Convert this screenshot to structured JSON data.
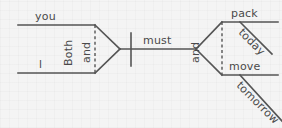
{
  "diagram": {
    "type": "reed-kellogg-sentence-diagram",
    "sentence": "Both you and I must pack today and move tomorrow.",
    "colors": {
      "background": "#f4f4f4",
      "line": "#555555",
      "text": "#4a4a4a"
    },
    "words": {
      "subject_1": "you",
      "subject_2": "I",
      "conjunction_left_1": "Both",
      "conjunction_left_2": "and",
      "verb_helper": "must",
      "conjunction_right": "and",
      "verb_1": "pack",
      "modifier_1": "today",
      "verb_2": "move",
      "modifier_2": "tomorrow"
    }
  }
}
